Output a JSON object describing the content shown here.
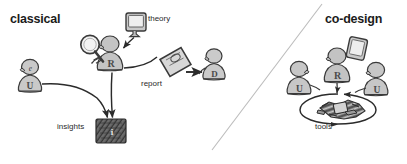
{
  "diagram": {
    "background_color": "#ffffff",
    "ink_color": "#2b2b2b",
    "fill_light": "#d2d2d2",
    "fill_mid": "#b4b4b4",
    "fill_dark": "#6e6e6e",
    "divider": {
      "name": "panel-divider",
      "x1": 212,
      "y1": 150,
      "x2": 322,
      "y2": 4,
      "color": "#b9b9b9"
    }
  },
  "panels": {
    "left": {
      "title": "classical"
    },
    "right": {
      "title": "co-design"
    }
  },
  "labels": {
    "theory": "theory",
    "report": "report",
    "insights": "insights",
    "tools": "tools"
  },
  "figures": {
    "classical": [
      {
        "name": "user-figure",
        "letter": "U",
        "x": 30,
        "y": 83
      },
      {
        "name": "researcher-figure",
        "letter": "R",
        "x": 107,
        "y": 55
      },
      {
        "name": "designer-figure",
        "letter": "D",
        "x": 213,
        "y": 65
      }
    ],
    "codesign": [
      {
        "name": "user-figure-left",
        "letter": "U",
        "x": 298,
        "y": 82
      },
      {
        "name": "researcher-figure",
        "letter": "R",
        "x": 337,
        "y": 70
      },
      {
        "name": "user-figure-right",
        "letter": "U",
        "x": 375,
        "y": 83
      }
    ]
  },
  "objects": {
    "theory_monitor": {
      "name": "theory-monitor-icon",
      "x": 127,
      "y": 22
    },
    "magnifier": {
      "name": "magnifying-glass-icon",
      "x": 90,
      "y": 44
    },
    "report_document": {
      "name": "report-document-icon",
      "x": 178,
      "y": 52
    },
    "insights_block": {
      "name": "insights-block",
      "x": 111,
      "y": 122
    },
    "codesign_tablet": {
      "name": "tablet-icon",
      "x": 355,
      "y": 48
    },
    "tools_pile": {
      "name": "tools-pile",
      "x": 338,
      "y": 107
    }
  },
  "arrows": {
    "user_to_insights": {
      "name": "arrow-user-to-insights",
      "from": "user-figure",
      "to": "insights-block"
    },
    "researcher_to_insights": {
      "name": "arrow-researcher-to-insights",
      "from": "researcher-figure",
      "to": "insights-block"
    },
    "theory_to_researcher": {
      "name": "arrow-theory-to-researcher",
      "from": "theory-monitor-icon",
      "to": "researcher-figure"
    },
    "report_to_designer": {
      "name": "arrow-report-to-designer",
      "from": "report-document-icon",
      "to": "designer-figure"
    },
    "tools_cycle": {
      "name": "arrow-tools-cycle",
      "shape": "ellipse-loop"
    }
  }
}
